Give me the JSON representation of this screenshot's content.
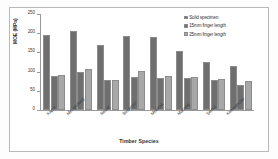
{
  "chart_data": {
    "type": "bar",
    "title": "",
    "xlabel": "Timber Species",
    "ylabel": "MOE (MPa)",
    "ylim": [
      0,
      250
    ],
    "yticks": [
      0,
      50,
      100,
      150,
      200,
      250
    ],
    "grid": false,
    "legend_position": "top-right",
    "categories": [
      "Kapur",
      "Mengkulang",
      "Resak",
      "Bintangor",
      "Melunak",
      "Mahang",
      "Sentul",
      "Kelempayan"
    ],
    "series": [
      {
        "name": "Solid specimen",
        "color": "#6f6f6f",
        "values": [
          196,
          205,
          169,
          194,
          191,
          154,
          126,
          115
        ]
      },
      {
        "name": "15mm finger length",
        "color": "#6f6f6f",
        "values": [
          88,
          100,
          78,
          87,
          83,
          83,
          78,
          64
        ]
      },
      {
        "name": "25mm finger length",
        "color": "#a8a8a8",
        "values": [
          91,
          108,
          79,
          102,
          89,
          87,
          81,
          76
        ]
      }
    ]
  }
}
